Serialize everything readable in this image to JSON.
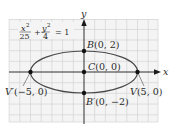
{
  "diagram": {
    "type": "ellipse-graph",
    "equation": {
      "x_term_num": "x",
      "x_term_exp": "2",
      "x_term_den": "25",
      "plus": "+",
      "y_term_num": "y",
      "y_term_exp": "2",
      "y_term_den": "4",
      "equals": "= 1"
    },
    "axes": {
      "x_label": "x",
      "y_label": "y"
    },
    "points": {
      "B": {
        "letter": "B",
        "coords": "(0, 2)"
      },
      "C": {
        "letter": "C",
        "coords": "(0, 0)"
      },
      "B_prime": {
        "letter": "B′",
        "coords": "(0, −2)"
      },
      "V_prime": {
        "letter": "V′",
        "coords": "(−5, 0)"
      },
      "V": {
        "letter": "V",
        "coords": "(5, 0)"
      }
    },
    "colors": {
      "grid": "#c9c9c9",
      "grid_bg": "#f2f2f2",
      "axis": "#1a1a1a",
      "ellipse": "#4a4a4a",
      "point": "#111111"
    }
  }
}
